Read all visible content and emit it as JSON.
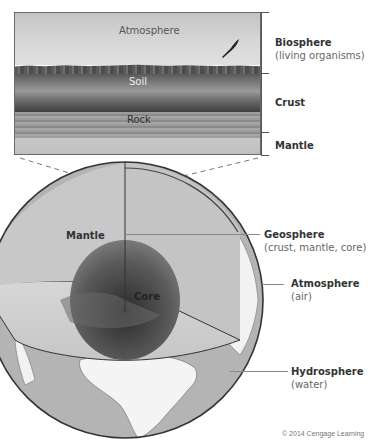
{
  "photo_panel": {
    "labels": {
      "atmosphere": "Atmosphere",
      "soil": "Soil",
      "rock": "Rock"
    },
    "bracket_labels": [
      {
        "title": "Biosphere",
        "subtitle": "(living organisms)"
      },
      {
        "title": "Crust",
        "subtitle": ""
      },
      {
        "title": "Mantle",
        "subtitle": ""
      }
    ]
  },
  "globe": {
    "interior_labels": {
      "mantle": "Mantle",
      "core": "Core"
    },
    "callouts": [
      {
        "title": "Geosphere",
        "subtitle": "(crust, mantle, core)"
      },
      {
        "title": "Atmosphere",
        "subtitle": "(air)"
      },
      {
        "title": "Hydrosphere",
        "subtitle": "(water)"
      }
    ]
  },
  "colors": {
    "line": "#555555",
    "mantle": "#c2c2c2",
    "core_dark": "#3a3a3a",
    "ocean": "#b0b0b0",
    "land": "#f4f4f4"
  },
  "copyright": "© 2014 Cengage Learning"
}
